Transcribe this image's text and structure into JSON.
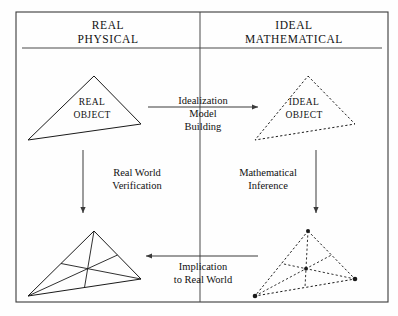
{
  "figure": {
    "kind": "two-column-modeling-cycle-diagram",
    "frame": {
      "x": 16,
      "y": 12,
      "width": 372,
      "height": 290
    },
    "column_divider_x": 200,
    "header_rule": {
      "x1": 22,
      "x2": 382,
      "y": 48
    },
    "columns": [
      {
        "id": "real-physical",
        "heading_line1": "REAL",
        "heading_line2": "PHYSICAL",
        "heading_x": 108,
        "heading_y1": 29,
        "heading_y2": 43
      },
      {
        "id": "ideal-mathematical",
        "heading_line1": "IDEAL",
        "heading_line2": "MATHEMATICAL",
        "heading_x": 294,
        "heading_y1": 29,
        "heading_y2": 43
      }
    ],
    "shapes": [
      {
        "id": "real-object-triangle",
        "name": "real-object-triangle",
        "style": "solid",
        "label_line1": "REAL",
        "label_line2": "OBJECT",
        "label_x": 92,
        "label_y1": 105,
        "label_y2": 118,
        "points": "94,76 141,124 28,140",
        "cevians": [],
        "dots": []
      },
      {
        "id": "ideal-object-triangle",
        "name": "ideal-object-triangle",
        "style": "dashed",
        "label_line1": "IDEAL",
        "label_line2": "OBJECT",
        "label_x": 304,
        "label_y1": 105,
        "label_y2": 118,
        "points": "308,76 355,124 255,140",
        "cevians": [],
        "dots": []
      },
      {
        "id": "real-object-analysed-triangle",
        "name": "real-object-analysed-triangle",
        "style": "solid",
        "label_line1": "",
        "label_line2": "",
        "label_x": 0,
        "label_y1": 0,
        "label_y2": 0,
        "points": "94,231 141,279 28,296",
        "cevians": [
          "94,231 84.5,287.5",
          "141,279 61,263.5",
          "28,296 117.5,255"
        ],
        "dots": []
      },
      {
        "id": "ideal-object-analysed-triangle",
        "name": "ideal-object-analysed-triangle",
        "style": "dashed",
        "label_line1": "",
        "label_line2": "",
        "label_x": 0,
        "label_y1": 0,
        "label_y2": 0,
        "points": "308,231 355,279 255,296",
        "cevians": [
          "308,231 305,287.5",
          "355,279 281.5,263.5",
          "255,296 331.5,255"
        ],
        "dots": [
          {
            "cx": 308,
            "cy": 231,
            "r": 2
          },
          {
            "cx": 355,
            "cy": 279,
            "r": 2.3
          },
          {
            "cx": 255,
            "cy": 296,
            "r": 2.3
          },
          {
            "cx": 306,
            "cy": 268.7,
            "r": 1.9
          }
        ]
      }
    ],
    "arrows": [
      {
        "id": "idealization-arrow",
        "name": "idealization-arrow",
        "direction": "right",
        "x1": 148,
        "y1": 107,
        "x2": 258,
        "y2": 107,
        "label_lines": [
          "Idealization",
          "Model",
          "Building"
        ],
        "label_x": 203,
        "label_y_first": 104,
        "label_line_height": 13
      },
      {
        "id": "real-world-verification-arrow",
        "name": "real-world-verification-arrow",
        "direction": "down",
        "x1": 83,
        "y1": 150,
        "x2": 83,
        "y2": 213,
        "label_lines": [
          "Real World",
          "Verification"
        ],
        "label_x": 137,
        "label_y_first": 176,
        "label_line_height": 13
      },
      {
        "id": "mathematical-inference-arrow",
        "name": "mathematical-inference-arrow",
        "direction": "down",
        "x1": 316,
        "y1": 150,
        "x2": 316,
        "y2": 213,
        "label_lines": [
          "Mathematical",
          "Inference"
        ],
        "label_x": 268,
        "label_y_first": 176,
        "label_line_height": 13
      },
      {
        "id": "implication-arrow",
        "name": "implication-arrow",
        "direction": "left",
        "x1": 258,
        "y1": 256,
        "x2": 146,
        "y2": 256,
        "label_lines": [
          "Implication",
          "to Real World"
        ],
        "label_x": 203,
        "label_y_first": 270,
        "label_line_height": 13
      }
    ]
  }
}
